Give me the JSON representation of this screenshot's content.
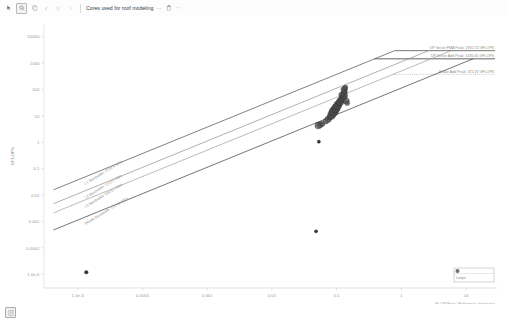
{
  "toolbar": {
    "cursor_icon": "cursor-icon",
    "zoom_icon": "magnifier-icon",
    "copy_icon": "copy-icon",
    "nav_prev_icon": "chevron-left-icon",
    "nav_first_icon": "chevron-first-icon",
    "nav_next_icon": "chevron-right-icon",
    "doc_title": "Cores used for roof modeling",
    "more_icon": "more-horizontal-icon",
    "delete_icon": "trash-icon",
    "caret_icon": "chevron-down-icon",
    "dots": "···"
  },
  "bottom": {
    "page_icon": "page-icon",
    "caption": ""
  },
  "chart_data": {
    "type": "scatter",
    "title": "",
    "xlabel": "FLOP/Byte (Arithmetic Intensity)",
    "ylabel": "GFLOP/s",
    "xscale": "log",
    "yscale": "log",
    "xlim": [
      3e-06,
      30
    ],
    "ylim": [
      3e-06,
      30000
    ],
    "grid": false,
    "xticks": [
      "1.0e-5",
      "0.0001",
      "0.001",
      "0.01",
      "0.1",
      "1",
      "10"
    ],
    "xtick_values": [
      1e-05,
      0.0001,
      0.001,
      0.01,
      0.1,
      1,
      10
    ],
    "yticks": [
      "10000",
      "1000",
      "100",
      "10",
      "1",
      "0.1",
      "0.01",
      "0.001",
      "0.0001",
      "1.0e-5"
    ],
    "ytick_values": [
      10000,
      1000,
      100,
      10,
      1,
      0.1,
      0.01,
      0.001,
      0.0001,
      1e-05
    ],
    "ceilings": [
      {
        "name": "DP Vector FMA Peak",
        "value": "2932.72 GFLOPS",
        "label": "DP Vector FMA Peak: 2932.72 GFLOPS",
        "color": "#4a4a4a",
        "style": "solid"
      },
      {
        "name": "DP Vector Add Peak",
        "value": "1435.65 GFLOPS",
        "label": "DP Vector Add Peak: 1435.65 GFLOPS",
        "color": "#2f2f2f",
        "style": "solid"
      },
      {
        "name": "Scalar Add Peak",
        "value": "372.37 GFLOPS",
        "label": "Scalar Add Peak: 372.37 GFLOPS",
        "color": "#9a9a9a",
        "style": "dotted"
      }
    ],
    "bandwidth_roofs": [
      {
        "name": "L1 Bandwidth",
        "value": "3733.4 GB/s",
        "label": "L1 Bandwidth: 3733.4 GB/s",
        "color": "#4a4a4a"
      },
      {
        "name": "L2 Bandwidth",
        "value": "1113.3 GB/s",
        "label": "L2 Bandwidth: 1113.3 GB/s",
        "color": "#8e8e8e"
      },
      {
        "name": "L3 Bandwidth",
        "value": "500.51 GB/s",
        "label": "L3 Bandwidth: 500.51 GB/s",
        "color": "#9e9e9e"
      },
      {
        "name": "DRAM Bandwidth",
        "value": "112.49 GB/s",
        "label": "DRAM Bandwidth: 112.49 GB/s",
        "color": "#3a3a3a"
      }
    ],
    "series": [
      {
        "name": "Loops",
        "color": "#4d4d4d",
        "points": [
          {
            "x": 0.052,
            "y": 4.3,
            "r": 3.4
          },
          {
            "x": 0.056,
            "y": 4.6,
            "r": 3.0
          },
          {
            "x": 0.06,
            "y": 5.0,
            "r": 2.6
          },
          {
            "x": 0.068,
            "y": 6.2,
            "r": 2.8
          },
          {
            "x": 0.074,
            "y": 7.4,
            "r": 3.2
          },
          {
            "x": 0.078,
            "y": 8.6,
            "r": 2.6
          },
          {
            "x": 0.082,
            "y": 9.8,
            "r": 3.6
          },
          {
            "x": 0.085,
            "y": 11.5,
            "r": 4.2
          },
          {
            "x": 0.088,
            "y": 13.0,
            "r": 3.6
          },
          {
            "x": 0.09,
            "y": 14.5,
            "r": 4.6
          },
          {
            "x": 0.092,
            "y": 16.0,
            "r": 4.0
          },
          {
            "x": 0.095,
            "y": 17.5,
            "r": 3.4
          },
          {
            "x": 0.097,
            "y": 19.0,
            "r": 4.4
          },
          {
            "x": 0.099,
            "y": 21.0,
            "r": 3.8
          },
          {
            "x": 0.101,
            "y": 23.0,
            "r": 3.2
          },
          {
            "x": 0.104,
            "y": 25.5,
            "r": 4.0
          },
          {
            "x": 0.107,
            "y": 28.0,
            "r": 3.4
          },
          {
            "x": 0.11,
            "y": 31.0,
            "r": 3.0
          },
          {
            "x": 0.113,
            "y": 34.0,
            "r": 3.8
          },
          {
            "x": 0.116,
            "y": 38.0,
            "r": 3.2
          },
          {
            "x": 0.119,
            "y": 42.0,
            "r": 2.8
          },
          {
            "x": 0.123,
            "y": 47.0,
            "r": 3.6
          },
          {
            "x": 0.127,
            "y": 52.0,
            "r": 3.0
          },
          {
            "x": 0.131,
            "y": 58.0,
            "r": 3.4
          },
          {
            "x": 0.118,
            "y": 62.0,
            "r": 2.6
          },
          {
            "x": 0.128,
            "y": 70.0,
            "r": 3.0
          },
          {
            "x": 0.134,
            "y": 80.0,
            "r": 2.4
          },
          {
            "x": 0.13,
            "y": 95.0,
            "r": 3.2
          },
          {
            "x": 0.133,
            "y": 108.0,
            "r": 2.6
          },
          {
            "x": 0.137,
            "y": 120.0,
            "r": 2.2
          },
          {
            "x": 0.141,
            "y": 36.0,
            "r": 3.0
          },
          {
            "x": 0.145,
            "y": 30.0,
            "r": 2.4
          }
        ]
      },
      {
        "name": "Outliers",
        "color": "#2a2a2a",
        "points": [
          {
            "x": 0.053,
            "y": 1.05,
            "r": 1.6
          },
          {
            "x": 0.048,
            "y": 0.00042,
            "r": 1.6
          },
          {
            "x": 1.35e-05,
            "y": 1.18e-05,
            "r": 1.8
          }
        ]
      }
    ],
    "legend": {
      "position": "bottom-right",
      "entries": [
        {
          "label": "Loops",
          "marker": "circle",
          "color": "#4d4d4d"
        }
      ]
    }
  }
}
